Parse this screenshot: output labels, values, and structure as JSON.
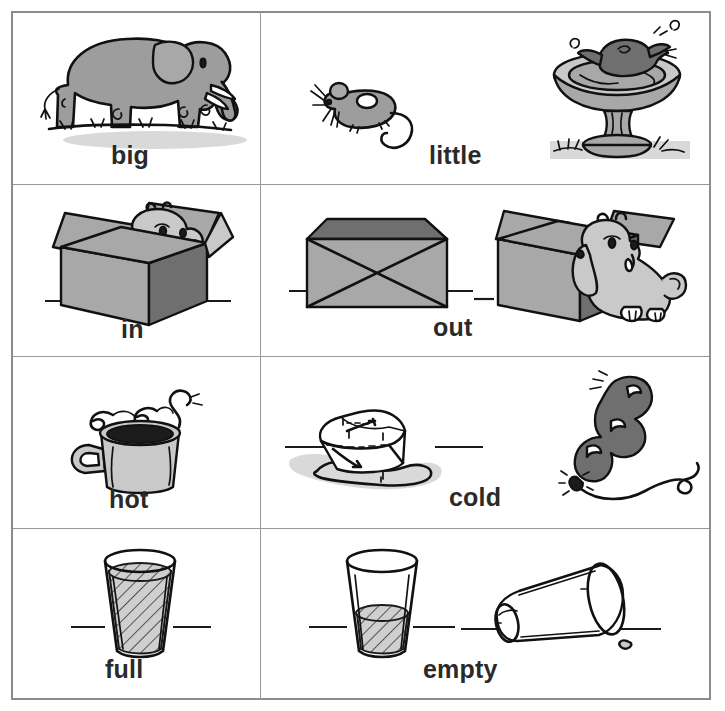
{
  "worksheet": {
    "title": "Opposites picture worksheet",
    "columns": 2,
    "rows": 4,
    "border_color": "#8c8c8c",
    "grid_line_color": "#9a9a9a",
    "background": "#ffffff",
    "label_color": "#2a2a2a"
  },
  "pairs": [
    {
      "index": 1,
      "left": {
        "label": "big",
        "illustrations": [
          {
            "name": "elephant-illustration",
            "alt": "gray elephant standing on grass"
          }
        ]
      },
      "right": {
        "label": "little",
        "illustrations": [
          {
            "name": "mouse-illustration",
            "alt": "small gray mouse with long tail"
          },
          {
            "name": "birdbath-illustration",
            "alt": "bird splashing in a stone birdbath"
          }
        ]
      }
    },
    {
      "index": 2,
      "left": {
        "label": "in",
        "illustrations": [
          {
            "name": "dog-in-box-illustration",
            "alt": "puppy sitting inside an open cardboard box"
          }
        ]
      },
      "right": {
        "label": "out",
        "illustrations": [
          {
            "name": "closed-box-illustration",
            "alt": "closed cardboard box taped with an X"
          },
          {
            "name": "dog-out-of-box-illustration",
            "alt": "puppy sitting outside an open cardboard box"
          }
        ]
      }
    },
    {
      "index": 3,
      "left": {
        "label": "hot",
        "illustrations": [
          {
            "name": "steaming-mug-illustration",
            "alt": "mug of hot coffee with rising steam"
          }
        ]
      },
      "right": {
        "label": "cold",
        "illustrations": [
          {
            "name": "ice-cube-illustration",
            "alt": "melting ice cube in a puddle"
          },
          {
            "name": "balloon-illustration",
            "alt": "long twisted balloon with curled string"
          }
        ]
      }
    },
    {
      "index": 4,
      "left": {
        "label": "full",
        "illustrations": [
          {
            "name": "full-glass-illustration",
            "alt": "drinking glass filled to the top"
          }
        ]
      },
      "right": {
        "label": "empty",
        "illustrations": [
          {
            "name": "partly-filled-glass-illustration",
            "alt": "drinking glass with a small amount of liquid"
          },
          {
            "name": "tipped-empty-glass-illustration",
            "alt": "empty glass lying on its side with one drop"
          }
        ]
      }
    }
  ]
}
